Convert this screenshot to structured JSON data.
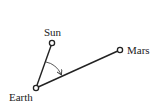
{
  "diagram": {
    "bodies": [
      {
        "id": "sun",
        "label": "Sun",
        "x": 52,
        "y": 43
      },
      {
        "id": "earth",
        "label": "Earth",
        "x": 36,
        "y": 88
      },
      {
        "id": "mars",
        "label": "Mars",
        "x": 120,
        "y": 50
      }
    ],
    "lines": [
      {
        "from": "earth",
        "to": "sun"
      },
      {
        "from": "earth",
        "to": "mars"
      }
    ],
    "angle_arc": {
      "vertex": "earth",
      "from": "sun",
      "to": "mars",
      "arrow": true
    },
    "colors": {
      "stroke": "#222222",
      "background": "#ffffff"
    }
  }
}
